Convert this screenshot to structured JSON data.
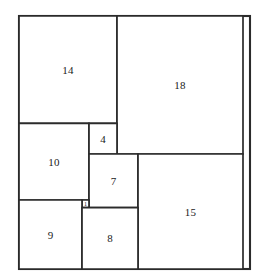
{
  "figure": {
    "kind": "squared-square-diagram",
    "outer_square_order": 33,
    "stroke_color": "#2b2b2b",
    "fill_color": "#ffffff",
    "label_color": "#1a1a1a",
    "pixel_frame": {
      "left": 19,
      "top": 16,
      "width": 231,
      "height": 253
    },
    "unit_frame": {
      "size": 33
    },
    "squares": [
      {
        "label": "14",
        "size": 14,
        "x": 0,
        "y": 0,
        "name": "square-14"
      },
      {
        "label": "18",
        "size": 18,
        "x": 14,
        "y": 0,
        "name": "square-18"
      },
      {
        "label": "10",
        "size": 10,
        "x": 0,
        "y": 14,
        "name": "square-10"
      },
      {
        "label": "4",
        "size": 4,
        "x": 10,
        "y": 14,
        "name": "square-4"
      },
      {
        "label": "7",
        "size": 7,
        "x": 10,
        "y": 18,
        "name": "square-7"
      },
      {
        "label": "15",
        "size": 15,
        "x": 17,
        "y": 18,
        "name": "square-15"
      },
      {
        "label": "1",
        "size": 1,
        "x": 9,
        "y": 24,
        "name": "square-1"
      },
      {
        "label": "9",
        "size": 9,
        "x": 0,
        "y": 24,
        "name": "square-9"
      },
      {
        "label": "8",
        "size": 8,
        "x": 9,
        "y": 25,
        "name": "square-8"
      }
    ]
  }
}
